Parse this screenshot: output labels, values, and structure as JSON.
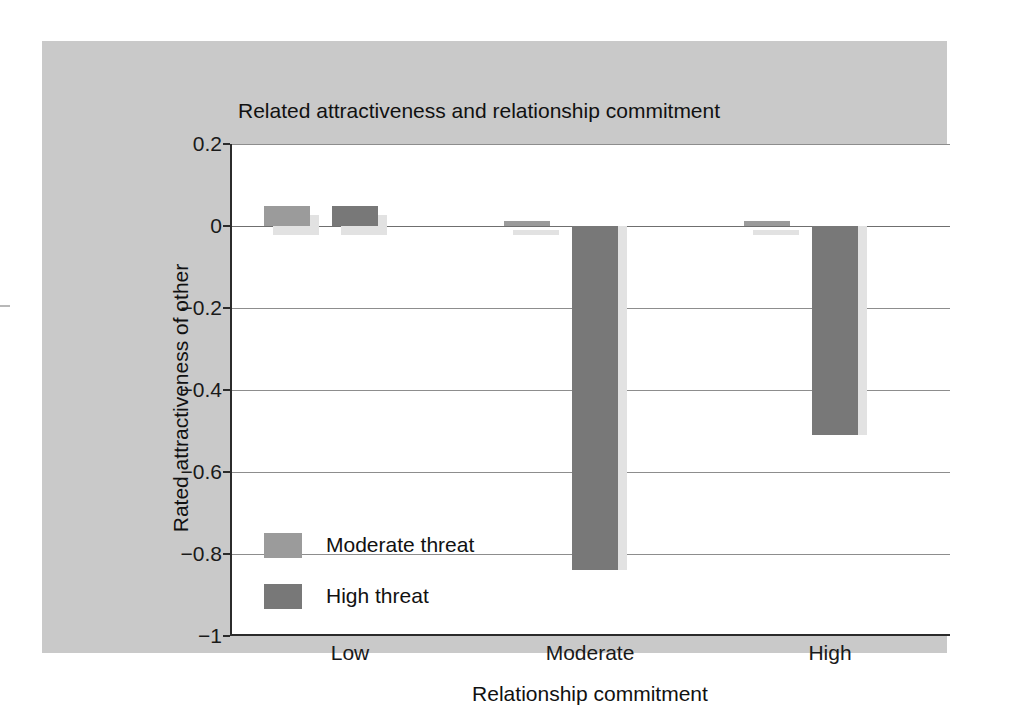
{
  "chart_data": {
    "type": "bar",
    "title": "Related attractiveness and relationship commitment",
    "xlabel": "Relationship commitment",
    "ylabel": "Rated attractiveness of other",
    "categories": [
      "Low",
      "Moderate",
      "High"
    ],
    "series": [
      {
        "name": "Moderate threat",
        "color": "#9b9b9b",
        "values": [
          0.05,
          0.012,
          0.012
        ]
      },
      {
        "name": "High threat",
        "color": "#787878",
        "values": [
          0.05,
          -0.84,
          -0.51
        ]
      }
    ],
    "ylim": [
      -1,
      0.2
    ],
    "yticks": [
      0.2,
      0,
      -0.2,
      -0.4,
      -0.6,
      -0.8,
      -1
    ],
    "ytick_labels": [
      "0.2",
      "0",
      "−0.2",
      "−0.4",
      "−0.6",
      "−0.8",
      "−1"
    ],
    "grid": true,
    "legend_position": "inside-lower-left"
  },
  "legend": {
    "items": [
      {
        "label": "Moderate threat",
        "color": "#9b9b9b"
      },
      {
        "label": "High threat",
        "color": "#787878"
      }
    ]
  },
  "colors": {
    "page_background": "#ffffff",
    "panel_background": "#c9c9c9",
    "plot_background": "#ffffff",
    "axis": "#2b2b2b",
    "gridline": "#8d8d8d",
    "bar_shadow": "#e2e2e2",
    "moderate_threat": "#9b9b9b",
    "high_threat": "#787878",
    "text": "#111111"
  }
}
